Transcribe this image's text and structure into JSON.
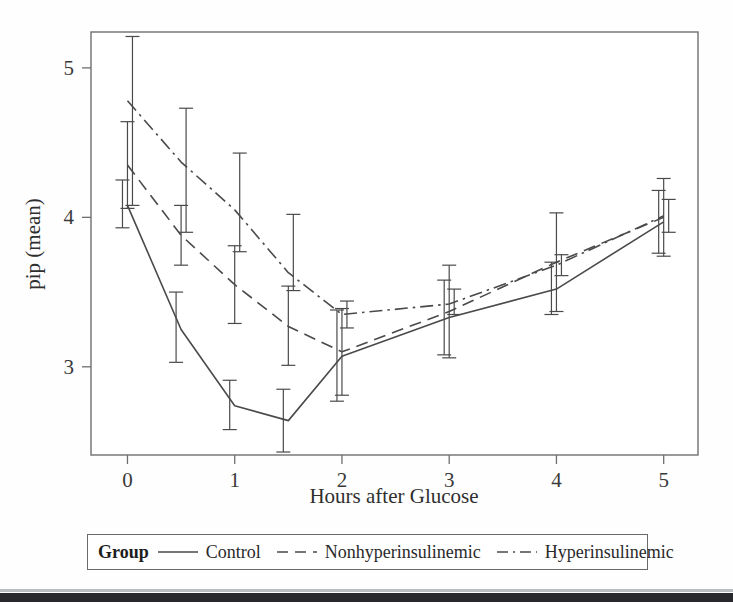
{
  "figure": {
    "xlabel": "Hours after Glucose",
    "ylabel": "pip (mean)",
    "x_tick_labels": [
      "0",
      "1",
      "2",
      "3",
      "4",
      "5"
    ],
    "y_tick_labels": [
      "3",
      "4",
      "5"
    ]
  },
  "legend": {
    "title": "Group",
    "entries": [
      {
        "label": "Control",
        "style": "solid"
      },
      {
        "label": "Nonhyperinsulinemic",
        "style": "dashed"
      },
      {
        "label": "Hyperinsulinemic",
        "style": "dash-dot"
      }
    ]
  },
  "chart_data": {
    "type": "line",
    "title": "",
    "xlabel": "Hours after Glucose",
    "ylabel": "pip (mean)",
    "xlim": [
      -0.34,
      5.32
    ],
    "ylim": [
      2.41,
      5.24
    ],
    "xticks": [
      0,
      1,
      2,
      3,
      4,
      5
    ],
    "yticks": [
      3,
      4,
      5
    ],
    "grid": false,
    "legend_position": "below-plot",
    "error_bars": "vertical, capped",
    "x": [
      0,
      0.5,
      1,
      1.5,
      2,
      3,
      4,
      5
    ],
    "series": [
      {
        "name": "Control",
        "style": "solid",
        "color": "#4a4a4a",
        "values": [
          4.08,
          3.25,
          2.74,
          2.64,
          3.07,
          3.33,
          3.52,
          3.97
        ],
        "err_low": [
          3.93,
          3.03,
          2.58,
          2.43,
          2.77,
          3.08,
          3.35,
          3.76
        ],
        "err_high": [
          4.25,
          3.5,
          2.91,
          2.85,
          3.38,
          3.58,
          3.7,
          4.18
        ]
      },
      {
        "name": "Nonhyperinsulinemic",
        "style": "dashed",
        "color": "#4a4a4a",
        "values": [
          4.35,
          3.88,
          3.55,
          3.27,
          3.1,
          3.37,
          3.7,
          4.0
        ],
        "err_low": [
          4.06,
          3.68,
          3.29,
          3.01,
          2.81,
          3.06,
          3.37,
          3.74
        ],
        "err_high": [
          4.64,
          4.08,
          3.81,
          3.54,
          3.39,
          3.68,
          4.03,
          4.26
        ]
      },
      {
        "name": "Hyperinsulinemic",
        "style": "dash-dot",
        "color": "#4a4a4a",
        "values": [
          4.78,
          4.37,
          4.05,
          3.63,
          3.35,
          3.42,
          3.68,
          4.01
        ],
        "err_low": [
          4.08,
          3.9,
          3.77,
          3.51,
          3.26,
          3.35,
          3.61,
          3.9
        ],
        "err_high": [
          5.21,
          4.73,
          4.43,
          4.02,
          3.44,
          3.52,
          3.75,
          4.12
        ]
      }
    ]
  }
}
